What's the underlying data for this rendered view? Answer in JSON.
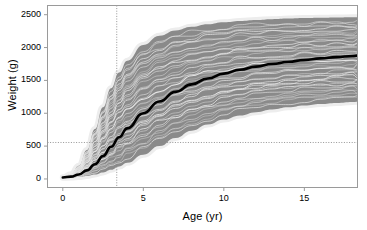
{
  "chart_data": {
    "type": "line",
    "title": "",
    "xlabel": "Age (yr)",
    "ylabel": "Weight (g)",
    "xlim": [
      -0.95,
      18.3
    ],
    "ylim": [
      -130,
      2640
    ],
    "xticks": [
      0,
      5,
      10,
      15
    ],
    "xtick_labels": [
      "0",
      "5",
      "10",
      "15"
    ],
    "yticks": [
      0,
      500,
      1000,
      1500,
      2000,
      2500
    ],
    "ytick_labels": [
      "0",
      "500",
      "1000",
      "1500",
      "2000",
      "2500"
    ],
    "grid": false,
    "legend": "none",
    "colors": {
      "band": "#8a8a8a",
      "median": "#000000",
      "spaghetti": "#d8d8d8",
      "reference_line": "#8a8a8a",
      "axis": "#9a9a9a",
      "background": "#ffffff"
    },
    "reference_lines": [
      {
        "orientation": "vertical",
        "value": 3.35,
        "style": "dotted",
        "label": ""
      },
      {
        "orientation": "horizontal",
        "value": 555,
        "style": "dotted",
        "label": ""
      }
    ],
    "x": [
      0,
      0.5,
      1,
      1.5,
      2,
      2.5,
      3,
      3.5,
      4,
      5,
      6,
      7,
      8,
      9,
      10,
      11,
      12,
      13,
      14,
      15,
      16,
      17,
      18,
      18.3
    ],
    "series": [
      {
        "name": "Upper prediction bound",
        "role": "band_upper",
        "values": [
          25,
          70,
          200,
          440,
          760,
          1090,
          1380,
          1620,
          1800,
          2040,
          2180,
          2260,
          2315,
          2355,
          2385,
          2405,
          2420,
          2432,
          2441,
          2448,
          2453,
          2457,
          2460,
          2461
        ]
      },
      {
        "name": "Lower prediction bound",
        "role": "band_lower",
        "values": [
          18,
          22,
          30,
          45,
          68,
          100,
          140,
          190,
          245,
          370,
          500,
          625,
          735,
          828,
          905,
          967,
          1017,
          1057,
          1090,
          1117,
          1139,
          1157,
          1172,
          1176
        ]
      },
      {
        "name": "Median growth curve",
        "role": "median",
        "values": [
          22,
          35,
          68,
          130,
          225,
          350,
          490,
          635,
          770,
          1000,
          1180,
          1325,
          1440,
          1530,
          1603,
          1662,
          1710,
          1750,
          1783,
          1811,
          1835,
          1855,
          1872,
          1877
        ]
      }
    ],
    "individual_trajectories_count": 40,
    "individual_trajectories_note": "Thin light-gray posterior draws of individual growth curves spanning the prediction band."
  },
  "figure": {
    "axis_title_y": "Weight (g)",
    "axis_title_x": "Age (yr)"
  }
}
